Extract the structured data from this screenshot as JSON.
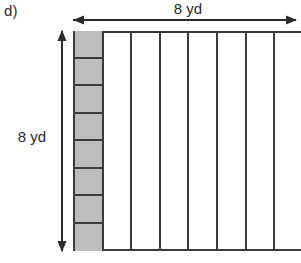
{
  "problem": {
    "part_label": "d)"
  },
  "dimensions": {
    "top": {
      "label": "8 yd",
      "value": 8,
      "unit": "yd",
      "arrow": "double-headed-horizontal"
    },
    "left": {
      "label": "8 yd",
      "value": 8,
      "unit": "yd",
      "arrow": "double-headed-vertical"
    }
  },
  "figure": {
    "shape": "square",
    "columns_total": 8,
    "rows_in_shaded_column": 8,
    "shaded_column_index": 0,
    "colors": {
      "shaded_fill": "#bdbdbd",
      "stroke": "#3a3a3a",
      "background": "#ffffff",
      "text": "#2b2b2b"
    },
    "columns": [
      {
        "index": 0,
        "shaded": true,
        "subdivided": true
      },
      {
        "index": 1,
        "shaded": false,
        "subdivided": false
      },
      {
        "index": 2,
        "shaded": false,
        "subdivided": false
      },
      {
        "index": 3,
        "shaded": false,
        "subdivided": false
      },
      {
        "index": 4,
        "shaded": false,
        "subdivided": false
      },
      {
        "index": 5,
        "shaded": false,
        "subdivided": false
      },
      {
        "index": 6,
        "shaded": false,
        "subdivided": false
      },
      {
        "index": 7,
        "shaded": false,
        "subdivided": false
      }
    ],
    "shaded_cells": [
      {
        "index": 0
      },
      {
        "index": 1
      },
      {
        "index": 2
      },
      {
        "index": 3
      },
      {
        "index": 4
      },
      {
        "index": 5
      },
      {
        "index": 6
      },
      {
        "index": 7
      }
    ]
  }
}
